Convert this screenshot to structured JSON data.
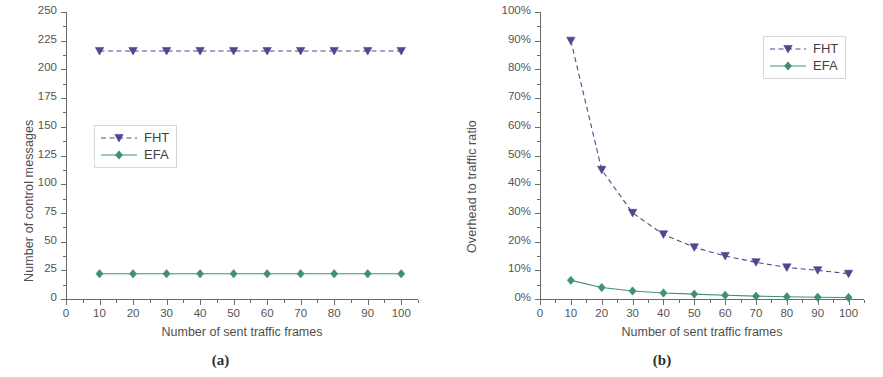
{
  "figure": {
    "panels": [
      {
        "caption": "(a)",
        "xlabel": "Number of sent traffic frames",
        "ylabel": "Number of control messages",
        "legend": {
          "position": "inside-left",
          "entries": [
            "FHT",
            "EFA"
          ]
        }
      },
      {
        "caption": "(b)",
        "xlabel": "Number of sent traffic frames",
        "ylabel": "Overhead to traffic ratio",
        "legend": {
          "position": "inside-right",
          "entries": [
            "FHT",
            "EFA"
          ]
        }
      }
    ]
  },
  "colors": {
    "fht": "#4a4a8c",
    "efa": "#3f8f7c",
    "axis": "#6b6b6b",
    "text": "#4f4f4f",
    "background": "#ffffff"
  },
  "chart_data": [
    {
      "type": "line",
      "panel": "(a)",
      "title": "",
      "xlabel": "Number of sent traffic frames",
      "ylabel": "Number of control messages",
      "x": [
        10,
        20,
        30,
        40,
        50,
        60,
        70,
        80,
        90,
        100
      ],
      "xlim": [
        0,
        105
      ],
      "ylim": [
        0,
        250
      ],
      "xticks": [
        0,
        10,
        20,
        30,
        40,
        50,
        60,
        70,
        80,
        90,
        100
      ],
      "yticks": [
        0,
        25,
        50,
        75,
        100,
        125,
        150,
        175,
        200,
        225,
        250
      ],
      "xticklabels": [
        "0",
        "10",
        "20",
        "30",
        "40",
        "50",
        "60",
        "70",
        "80",
        "90",
        "100"
      ],
      "yticklabels": [
        "0",
        "25",
        "50",
        "75",
        "100",
        "125",
        "150",
        "175",
        "200",
        "225",
        "250"
      ],
      "grid": false,
      "legend_position": "inside upper left",
      "series": [
        {
          "name": "FHT",
          "marker": "triangle-down",
          "linestyle": "dashed",
          "color": "#4a4a8c",
          "values": [
            216,
            216,
            216,
            216,
            216,
            216,
            216,
            216,
            216,
            216
          ]
        },
        {
          "name": "EFA",
          "marker": "diamond",
          "linestyle": "solid",
          "color": "#3f8f7c",
          "values": [
            22,
            22,
            22,
            22,
            22,
            22,
            22,
            22,
            22,
            22
          ]
        }
      ]
    },
    {
      "type": "line",
      "panel": "(b)",
      "title": "",
      "xlabel": "Number of sent traffic frames",
      "ylabel": "Overhead to traffic ratio",
      "x": [
        10,
        20,
        30,
        40,
        50,
        60,
        70,
        80,
        90,
        100
      ],
      "xlim": [
        0,
        105
      ],
      "ylim": [
        0,
        100
      ],
      "xticks": [
        0,
        10,
        20,
        30,
        40,
        50,
        60,
        70,
        80,
        90,
        100
      ],
      "yticks": [
        0,
        10,
        20,
        30,
        40,
        50,
        60,
        70,
        80,
        90,
        100
      ],
      "xticklabels": [
        "0",
        "10",
        "20",
        "30",
        "40",
        "50",
        "60",
        "70",
        "80",
        "90",
        "100"
      ],
      "yticklabels": [
        "0%",
        "10%",
        "20%",
        "30%",
        "40%",
        "50%",
        "60%",
        "70%",
        "80%",
        "90%",
        "100%"
      ],
      "grid": false,
      "legend_position": "inside upper right",
      "series": [
        {
          "name": "FHT",
          "marker": "triangle-down",
          "linestyle": "dashed",
          "color": "#4a4a8c",
          "values": [
            90,
            45,
            30,
            22.5,
            18,
            15,
            12.8,
            11,
            10,
            8.8
          ]
        },
        {
          "name": "EFA",
          "marker": "diamond",
          "linestyle": "solid",
          "color": "#3f8f7c",
          "values": [
            6.5,
            4.0,
            2.8,
            2.1,
            1.7,
            1.3,
            1.0,
            0.8,
            0.6,
            0.5
          ]
        }
      ]
    }
  ]
}
